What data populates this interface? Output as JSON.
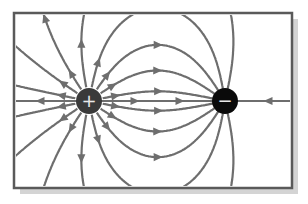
{
  "diagram": {
    "frame": {
      "x": 14,
      "y": 13,
      "width": 278,
      "height": 175,
      "stroke": "#5a5a5a",
      "shadow": "#9a9a9a"
    },
    "line_color": "#6e6e6e",
    "charges": [
      {
        "id": "positive",
        "symbol": "+",
        "cx": 89,
        "cy": 101,
        "r": 13,
        "fill": "#3a3a3a"
      },
      {
        "id": "negative",
        "symbol": "−",
        "cx": 225,
        "cy": 101,
        "r": 13,
        "fill": "#0a0a0a"
      }
    ]
  }
}
